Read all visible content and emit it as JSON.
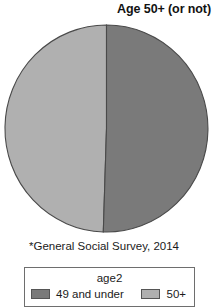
{
  "title": "Age 50+ (or not)",
  "source_note": "*General Social Survey, 2014",
  "legend": {
    "title": "age2",
    "entries": [
      {
        "label": "49 and under",
        "color": "#7a7a7a"
      },
      {
        "label": "50+",
        "color": "#b0b0b0"
      }
    ]
  },
  "chart_data": {
    "type": "pie",
    "title": "Age 50+ (or not)",
    "categories": [
      "49 and under",
      "50+"
    ],
    "values": [
      50.5,
      49.5
    ],
    "colors": [
      "#7a7a7a",
      "#b0b0b0"
    ],
    "legend_title": "age2",
    "legend_position": "bottom",
    "annotations": [
      "*General Social Survey, 2014"
    ],
    "start_angle_deg": 0,
    "direction": "clockwise",
    "xlabel": "",
    "ylabel": ""
  }
}
